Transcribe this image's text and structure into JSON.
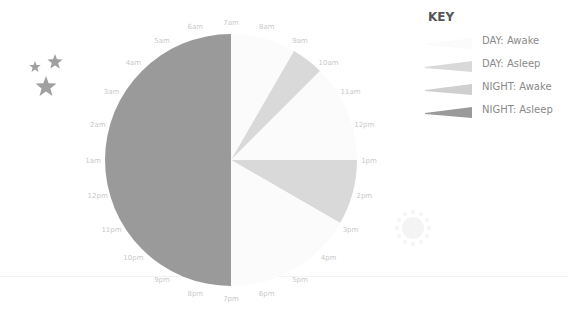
{
  "chart_data": {
    "type": "pie",
    "title": "",
    "subtitle": "24-hour sleep clock",
    "center": [
      231,
      160
    ],
    "radius": 126,
    "start_hour_label": "7am",
    "hours_per_turn": 24,
    "hour_labels": [
      "7am",
      "8am",
      "9am",
      "10am",
      "11am",
      "12pm",
      "1pm",
      "2pm",
      "3pm",
      "4pm",
      "5pm",
      "6pm",
      "7pm",
      "8pm",
      "9pm",
      "10pm",
      "11pm",
      "12pm",
      "1am",
      "2am",
      "3am",
      "4am",
      "5am",
      "6am"
    ],
    "segments": [
      {
        "category": "DAY: Awake",
        "start": "7am",
        "end": "9am",
        "hours": 2
      },
      {
        "category": "DAY: Asleep",
        "start": "9am",
        "end": "10am",
        "hours": 1
      },
      {
        "category": "DAY: Awake",
        "start": "10am",
        "end": "1pm",
        "hours": 3
      },
      {
        "category": "DAY: Asleep",
        "start": "1pm",
        "end": "3pm",
        "hours": 2
      },
      {
        "category": "DAY: Awake",
        "start": "3pm",
        "end": "7pm",
        "hours": 4
      },
      {
        "category": "NIGHT: Asleep",
        "start": "7pm",
        "end": "7am",
        "hours": 12
      }
    ],
    "legend_position": "top-right",
    "grid": false
  },
  "legend": {
    "title": "KEY",
    "items": [
      {
        "label": "DAY: Awake",
        "color": "#fbfbfb"
      },
      {
        "label": "DAY: Asleep",
        "color": "#d9d9d9"
      },
      {
        "label": "NIGHT: Awake",
        "color": "#cfcfcf"
      },
      {
        "label": "NIGHT: Asleep",
        "color": "#9a9a9a"
      }
    ]
  },
  "colors": {
    "day_awake": "#fbfbfb",
    "day_asleep": "#d9d9d9",
    "night_asleep": "#9a9a9a",
    "stars": "#a0a0a0",
    "sun": "#f4f4f4",
    "hour_label": "#c9c9c9"
  },
  "decorations": {
    "left_icon": "stars-icon",
    "right_icon": "sun-icon"
  }
}
